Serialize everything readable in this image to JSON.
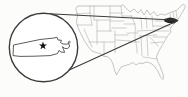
{
  "figure": {
    "country": "United States",
    "highlighted_state": "Massachusetts",
    "marker": "star",
    "colors": {
      "background": "#fcfcfa",
      "map_outline": "#a0a0a0",
      "inset_outline": "#3b3b3b",
      "state_outline": "#4a4a4a",
      "highlight_fill": "#242424",
      "star_fill": "#101010",
      "inset_fill": "#ffffff"
    }
  }
}
